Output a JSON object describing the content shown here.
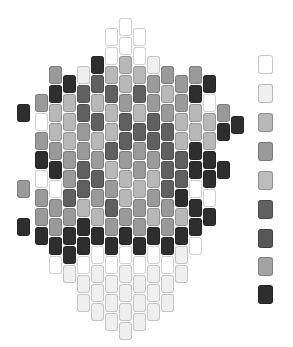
{
  "layout": {
    "bead_width": 14,
    "bead_height": 19
  },
  "palette": {
    "W": "#ffffff",
    "L": "#efefef",
    "G": "#b8b8b8",
    "M": "#9a9a9a",
    "S": "#bdbdbd",
    "D": "#606060",
    "E": "#575757",
    "A": "#a3a3a3",
    "K": "#2e2e2e"
  },
  "legend": [
    {
      "key": "W",
      "y": 55
    },
    {
      "key": "L",
      "y": 84
    },
    {
      "key": "G",
      "y": 113
    },
    {
      "key": "M",
      "y": 142
    },
    {
      "key": "S",
      "y": 171
    },
    {
      "key": "D",
      "y": 200
    },
    {
      "key": "E",
      "y": 229
    },
    {
      "key": "A",
      "y": 257
    },
    {
      "key": "K",
      "y": 285
    }
  ],
  "columns": [
    {
      "x": 17,
      "beads": [
        [
          104,
          "K"
        ],
        [
          180,
          "M"
        ],
        [
          218,
          "K"
        ]
      ]
    },
    {
      "x": 35,
      "beads": [
        [
          94,
          "M"
        ],
        [
          113,
          "W"
        ],
        [
          132,
          "M"
        ],
        [
          151,
          "K"
        ],
        [
          170,
          "W"
        ],
        [
          189,
          "M"
        ],
        [
          208,
          "M"
        ],
        [
          227,
          "K"
        ]
      ]
    },
    {
      "x": 49,
      "beads": [
        [
          66,
          "M"
        ],
        [
          85,
          "K"
        ],
        [
          104,
          "G"
        ],
        [
          123,
          "G"
        ],
        [
          142,
          "M"
        ],
        [
          161,
          "K"
        ],
        [
          180,
          "W"
        ],
        [
          199,
          "M"
        ],
        [
          218,
          "M"
        ],
        [
          237,
          "K"
        ],
        [
          256,
          "W"
        ]
      ]
    },
    {
      "x": 63,
      "beads": [
        [
          75,
          "K"
        ],
        [
          94,
          "G"
        ],
        [
          113,
          "G"
        ],
        [
          132,
          "G"
        ],
        [
          151,
          "M"
        ],
        [
          170,
          "M"
        ],
        [
          189,
          "D"
        ],
        [
          208,
          "M"
        ],
        [
          227,
          "K"
        ],
        [
          246,
          "K"
        ],
        [
          265,
          "L"
        ]
      ]
    },
    {
      "x": 77,
      "beads": [
        [
          66,
          "L"
        ],
        [
          85,
          "D"
        ],
        [
          104,
          "D"
        ],
        [
          123,
          "M"
        ],
        [
          142,
          "M"
        ],
        [
          161,
          "D"
        ],
        [
          180,
          "D"
        ],
        [
          199,
          "G"
        ],
        [
          218,
          "K"
        ],
        [
          237,
          "K"
        ],
        [
          256,
          "W"
        ],
        [
          275,
          "L"
        ],
        [
          294,
          "L"
        ]
      ]
    },
    {
      "x": 91,
      "beads": [
        [
          56,
          "K"
        ],
        [
          75,
          "D"
        ],
        [
          94,
          "G"
        ],
        [
          113,
          "D"
        ],
        [
          132,
          "G"
        ],
        [
          151,
          "M"
        ],
        [
          170,
          "D"
        ],
        [
          189,
          "M"
        ],
        [
          208,
          "G"
        ],
        [
          227,
          "K"
        ],
        [
          246,
          "W"
        ],
        [
          265,
          "L"
        ],
        [
          284,
          "L"
        ],
        [
          303,
          "L"
        ]
      ]
    },
    {
      "x": 105,
      "beads": [
        [
          28,
          "W"
        ],
        [
          47,
          "W"
        ],
        [
          66,
          "G"
        ],
        [
          85,
          "D"
        ],
        [
          104,
          "G"
        ],
        [
          123,
          "G"
        ],
        [
          142,
          "D"
        ],
        [
          161,
          "G"
        ],
        [
          180,
          "M"
        ],
        [
          199,
          "D"
        ],
        [
          218,
          "M"
        ],
        [
          237,
          "K"
        ],
        [
          256,
          "W"
        ],
        [
          275,
          "L"
        ],
        [
          294,
          "L"
        ],
        [
          313,
          "L"
        ]
      ]
    },
    {
      "x": 119,
      "beads": [
        [
          18,
          "W"
        ],
        [
          37,
          "W"
        ],
        [
          56,
          "G"
        ],
        [
          75,
          "G"
        ],
        [
          94,
          "M"
        ],
        [
          113,
          "D"
        ],
        [
          132,
          "D"
        ],
        [
          151,
          "M"
        ],
        [
          170,
          "G"
        ],
        [
          189,
          "G"
        ],
        [
          208,
          "M"
        ],
        [
          227,
          "K"
        ],
        [
          246,
          "W"
        ],
        [
          265,
          "L"
        ],
        [
          284,
          "L"
        ],
        [
          303,
          "L"
        ],
        [
          322,
          "L"
        ]
      ]
    },
    {
      "x": 133,
      "beads": [
        [
          28,
          "W"
        ],
        [
          47,
          "W"
        ],
        [
          66,
          "G"
        ],
        [
          85,
          "D"
        ],
        [
          104,
          "G"
        ],
        [
          123,
          "D"
        ],
        [
          142,
          "M"
        ],
        [
          161,
          "M"
        ],
        [
          180,
          "G"
        ],
        [
          199,
          "M"
        ],
        [
          218,
          "M"
        ],
        [
          237,
          "K"
        ],
        [
          256,
          "W"
        ],
        [
          275,
          "L"
        ],
        [
          294,
          "L"
        ],
        [
          313,
          "L"
        ]
      ]
    },
    {
      "x": 147,
      "beads": [
        [
          56,
          "L"
        ],
        [
          75,
          "M"
        ],
        [
          94,
          "M"
        ],
        [
          113,
          "D"
        ],
        [
          132,
          "D"
        ],
        [
          151,
          "M"
        ],
        [
          170,
          "G"
        ],
        [
          189,
          "M"
        ],
        [
          208,
          "G"
        ],
        [
          227,
          "K"
        ],
        [
          246,
          "W"
        ],
        [
          265,
          "L"
        ],
        [
          284,
          "L"
        ],
        [
          303,
          "L"
        ]
      ]
    },
    {
      "x": 161,
      "beads": [
        [
          66,
          "M"
        ],
        [
          85,
          "G"
        ],
        [
          104,
          "M"
        ],
        [
          123,
          "D"
        ],
        [
          142,
          "D"
        ],
        [
          161,
          "D"
        ],
        [
          180,
          "D"
        ],
        [
          199,
          "M"
        ],
        [
          218,
          "M"
        ],
        [
          237,
          "K"
        ],
        [
          256,
          "W"
        ],
        [
          275,
          "L"
        ],
        [
          294,
          "L"
        ]
      ]
    },
    {
      "x": 175,
      "beads": [
        [
          75,
          "M"
        ],
        [
          94,
          "M"
        ],
        [
          113,
          "G"
        ],
        [
          132,
          "G"
        ],
        [
          151,
          "D"
        ],
        [
          170,
          "D"
        ],
        [
          189,
          "K"
        ],
        [
          208,
          "G"
        ],
        [
          227,
          "K"
        ],
        [
          246,
          "L"
        ],
        [
          265,
          "L"
        ]
      ]
    },
    {
      "x": 189,
      "beads": [
        [
          66,
          "M"
        ],
        [
          85,
          "K"
        ],
        [
          104,
          "G"
        ],
        [
          123,
          "G"
        ],
        [
          142,
          "K"
        ],
        [
          161,
          "K"
        ],
        [
          180,
          "W"
        ],
        [
          199,
          "K"
        ],
        [
          218,
          "K"
        ],
        [
          237,
          "W"
        ]
      ]
    },
    {
      "x": 203,
      "beads": [
        [
          75,
          "K"
        ],
        [
          94,
          "W"
        ],
        [
          113,
          "G"
        ],
        [
          132,
          "G"
        ],
        [
          151,
          "K"
        ],
        [
          170,
          "K"
        ],
        [
          189,
          "W"
        ],
        [
          208,
          "K"
        ]
      ]
    },
    {
      "x": 217,
      "beads": [
        [
          104,
          "M"
        ],
        [
          123,
          "K"
        ],
        [
          161,
          "K"
        ]
      ]
    },
    {
      "x": 231,
      "beads": [
        [
          116,
          "K"
        ]
      ]
    }
  ]
}
